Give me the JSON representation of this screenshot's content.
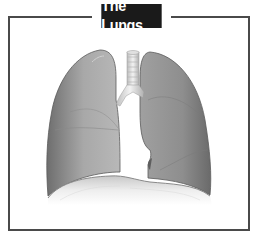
{
  "title": "The Lungs",
  "illustration": {
    "subject": "lungs-anatomy",
    "parts": [
      "left-lung",
      "right-lung",
      "trachea",
      "bronchi",
      "diaphragm"
    ]
  },
  "colors": {
    "frame": "#4a4a4a",
    "title_bg": "#1a1a1a",
    "title_text": "#ffffff",
    "lung_fill": "#9a9a9a",
    "lung_dark": "#6e6e6e",
    "diaphragm": "#d8d8d8"
  }
}
